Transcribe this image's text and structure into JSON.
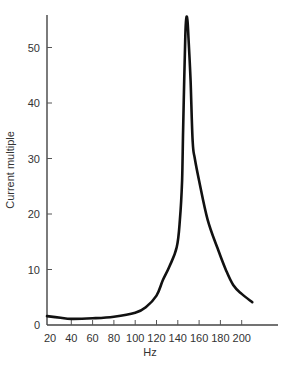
{
  "chart_data": {
    "type": "line",
    "title": "",
    "xlabel": "Hz",
    "ylabel": "Current multiple",
    "xlim": [
      20,
      230
    ],
    "ylim": [
      0,
      56
    ],
    "grid": false,
    "legend": null,
    "x_ticks": [
      20,
      40,
      60,
      80,
      100,
      120,
      140,
      160,
      180,
      200
    ],
    "y_ticks": [
      0,
      10,
      20,
      30,
      40,
      50
    ],
    "series": [
      {
        "name": "Current multiple",
        "color": "#111111",
        "x": [
          20,
          30,
          40,
          60,
          80,
          100,
          110,
          120,
          126,
          132,
          139,
          142,
          144,
          145,
          146,
          147,
          148,
          149,
          150,
          152,
          154,
          156,
          160,
          168,
          177,
          185,
          192,
          200,
          210
        ],
        "y": [
          1.6,
          1.3,
          1.1,
          1.2,
          1.5,
          2.2,
          3.2,
          5.3,
          8.1,
          10.5,
          14,
          19,
          26,
          35,
          44,
          52,
          55.3,
          55,
          52,
          44,
          33,
          30,
          26,
          19,
          14,
          10,
          7.2,
          5.6,
          4.1
        ]
      }
    ]
  }
}
